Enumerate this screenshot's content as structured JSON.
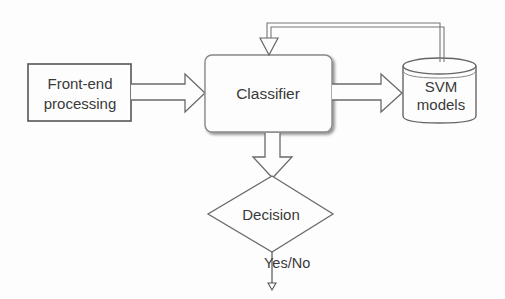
{
  "diagram": {
    "type": "flowchart",
    "nodes": {
      "frontend": {
        "line1": "Front-end",
        "line2": "processing"
      },
      "classifier": {
        "label": "Classifier"
      },
      "svm": {
        "line1": "SVM",
        "line2": "models"
      },
      "decision": {
        "label": "Decision"
      }
    },
    "edges": {
      "output_label": "Yes/No"
    },
    "colors": {
      "stroke": "#6a6a6a",
      "text": "#3a3a3a",
      "background": "#fdfdfd"
    }
  }
}
